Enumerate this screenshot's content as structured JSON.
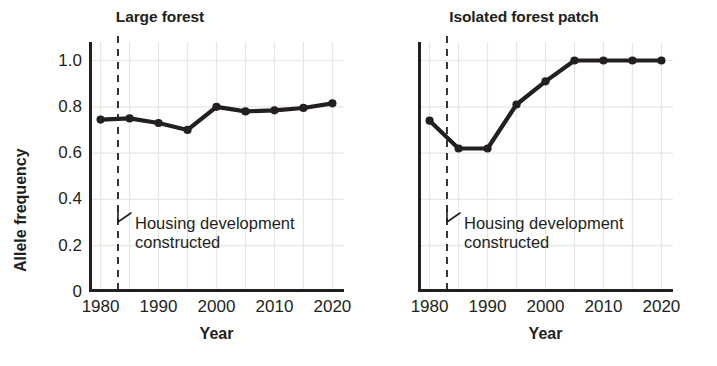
{
  "figure": {
    "background": "#ffffff",
    "ink_color": "#231f20",
    "grid_color": "#e6e6e6"
  },
  "chart_data": [
    {
      "type": "line",
      "title": "Large forest",
      "xlabel": "Year",
      "ylabel": "Allele frequency",
      "x": [
        1980,
        1985,
        1990,
        1995,
        2000,
        2005,
        2010,
        2015,
        2020
      ],
      "values": [
        0.745,
        0.75,
        0.73,
        0.7,
        0.8,
        0.78,
        0.785,
        0.795,
        0.815
      ],
      "xlim": [
        1978,
        2022
      ],
      "ylim": [
        0,
        1.08
      ],
      "xticks": [
        1980,
        1990,
        2000,
        2010,
        2020
      ],
      "xtick_labels": [
        "1980",
        "1990",
        "2000",
        "2010",
        "2020"
      ],
      "yticks": [
        0,
        0.2,
        0.4,
        0.6,
        0.8,
        1.0
      ],
      "ytick_labels": [
        "0",
        "0.2",
        "0.4",
        "0.6",
        "0.8",
        "1.0"
      ],
      "grid": true,
      "legend": "none",
      "marker": "filled-circle",
      "annotations": [
        {
          "type": "vertical-dashed-line",
          "x": 1983,
          "label_line1": "Housing development",
          "label_line2": "constructed"
        }
      ]
    },
    {
      "type": "line",
      "title": "Isolated forest patch",
      "xlabel": "Year",
      "ylabel": "",
      "x": [
        1980,
        1985,
        1990,
        1995,
        2000,
        2005,
        2010,
        2015,
        2020
      ],
      "values": [
        0.74,
        0.62,
        0.62,
        0.81,
        0.91,
        1.0,
        1.0,
        1.0,
        1.0
      ],
      "xlim": [
        1978,
        2022
      ],
      "ylim": [
        0,
        1.08
      ],
      "xticks": [
        1980,
        1990,
        2000,
        2010,
        2020
      ],
      "xtick_labels": [
        "1980",
        "1990",
        "2000",
        "2010",
        "2020"
      ],
      "yticks": [
        0,
        0.2,
        0.4,
        0.6,
        0.8,
        1.0
      ],
      "ytick_labels": [
        "",
        "",
        "",
        "",
        "",
        ""
      ],
      "grid": true,
      "legend": "none",
      "marker": "filled-circle",
      "annotations": [
        {
          "type": "vertical-dashed-line",
          "x": 1983,
          "label_line1": "Housing development",
          "label_line2": "constructed"
        }
      ]
    }
  ],
  "left_panel": {
    "title": "Large forest",
    "y_axis_title": "Allele frequency",
    "x_axis_title": "Year",
    "ytick_labels": [
      "1.0",
      "0.8",
      "0.6",
      "0.4",
      "0.2",
      "0"
    ],
    "xtick_labels": [
      "1980",
      "1990",
      "2000",
      "2010",
      "2020"
    ],
    "annotation_line1": "Housing development",
    "annotation_line2": "constructed"
  },
  "right_panel": {
    "title": "Isolated forest patch",
    "x_axis_title": "Year",
    "xtick_labels": [
      "1980",
      "1990",
      "2000",
      "2010",
      "2020"
    ],
    "annotation_line1": "Housing development",
    "annotation_line2": "constructed"
  }
}
